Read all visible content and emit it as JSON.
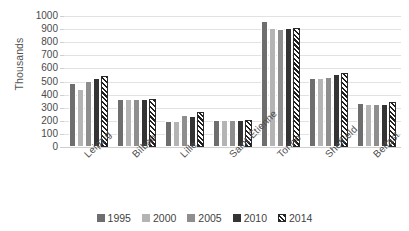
{
  "chart_data": {
    "type": "bar",
    "title": "",
    "xlabel": "",
    "ylabel": "Thousands",
    "ylim": [
      0,
      1000
    ],
    "ytick_step": 100,
    "yticks": [
      "1000",
      "900",
      "800",
      "700",
      "600",
      "500",
      "400",
      "300",
      "200",
      "100",
      "0"
    ],
    "grid": true,
    "legend_position": "bottom",
    "categories": [
      "Leipzig",
      "Bilbao",
      "Lille",
      "Saint-Étienne",
      "Torino",
      "Sheffield",
      "Belfast"
    ],
    "series": [
      {
        "name": "1995",
        "color": "#6e6e6e",
        "pattern": "solid",
        "values": [
          490,
          370,
          195,
          205,
          960,
          530,
          335
        ]
      },
      {
        "name": "2000",
        "color": "#b4b4b4",
        "pattern": "solid",
        "values": [
          440,
          370,
          200,
          205,
          910,
          530,
          330
        ]
      },
      {
        "name": "2005",
        "color": "#8e8e8e",
        "pattern": "solid",
        "values": [
          505,
          370,
          245,
          210,
          900,
          535,
          330
        ]
      },
      {
        "name": "2010",
        "color": "#343434",
        "pattern": "solid",
        "values": [
          525,
          370,
          240,
          210,
          910,
          560,
          330
        ]
      },
      {
        "name": "2014",
        "color": "#1f1f1f",
        "pattern": "diagonal-hatch",
        "values": [
          540,
          370,
          265,
          210,
          910,
          565,
          345
        ]
      }
    ]
  },
  "legend": {
    "items": [
      {
        "label": "1995"
      },
      {
        "label": "2000"
      },
      {
        "label": "2005"
      },
      {
        "label": "2010"
      },
      {
        "label": "2014"
      }
    ]
  }
}
